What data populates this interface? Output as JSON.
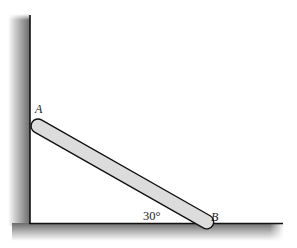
{
  "diagram": {
    "labels": {
      "point_a": "A",
      "point_b": "B",
      "angle": "30°"
    },
    "colors": {
      "rod_fill": "#dcdcdc",
      "outline": "#111111",
      "wall_shade_dark": "#6e6e6e",
      "wall_shade_light": "#ffffff"
    },
    "geometry": {
      "angle_deg": 30
    }
  }
}
